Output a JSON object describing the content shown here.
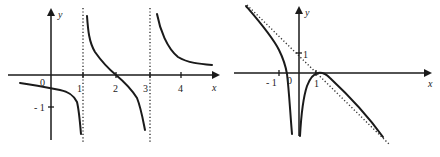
{
  "figure": {
    "colors": {
      "ink": "#1a1a1a",
      "background": "#ffffff"
    },
    "graphs": [
      {
        "id": "left",
        "x_axis_label": "x",
        "y_axis_label": "y",
        "origin_label": "0",
        "x_tick_labels": [
          "1",
          "2",
          "3",
          "4"
        ],
        "y_tick_labels": [
          "- 1"
        ],
        "vertical_asymptotes": [
          1,
          3
        ],
        "zeros": [
          2
        ]
      },
      {
        "id": "right",
        "x_axis_label": "x",
        "y_axis_label": "y",
        "origin_label": "0",
        "x_tick_labels": [
          "- 1",
          "1"
        ],
        "y_tick_labels": [
          "1"
        ],
        "vertical_asymptotes": [
          0
        ],
        "slant_asymptote": "y = -x + 1",
        "zeros": [
          -0.5,
          1
        ]
      }
    ]
  }
}
